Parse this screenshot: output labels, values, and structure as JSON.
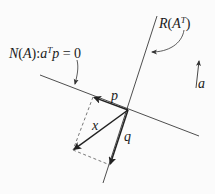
{
  "labels": {
    "nullspace_prefix": "N",
    "nullspace_paren_open": "(",
    "nullspace_A": "A",
    "nullspace_paren_close": ")",
    "nullspace_colon": ":",
    "nullspace_a": "a",
    "nullspace_T": "T",
    "nullspace_p": "p",
    "nullspace_eq": " = ",
    "nullspace_zero": "0",
    "rowspace_R": "R",
    "rowspace_paren_open": "(",
    "rowspace_A": "A",
    "rowspace_T": "T",
    "rowspace_paren_close": ")",
    "vector_p": "p",
    "vector_x": "x",
    "vector_q": "q",
    "vector_a": "a"
  },
  "colors": {
    "line": "#3a3a3a",
    "vector": "#222222",
    "dashed": "#555555",
    "text": "#1a1a1a",
    "background": "#fbfbfb"
  },
  "geometry": {
    "origin": [
      128,
      110
    ],
    "nullspace_line": [
      [
        40,
        75
      ],
      [
        199,
        136
      ]
    ],
    "rowspace_line": [
      [
        157,
        16
      ],
      [
        103,
        183
      ]
    ],
    "p_tip": [
      93,
      97
    ],
    "x_tip": [
      73,
      150
    ],
    "q_tip": [
      110,
      165
    ],
    "a_arrow": [
      [
        196,
        88
      ],
      [
        199,
        61
      ]
    ]
  }
}
